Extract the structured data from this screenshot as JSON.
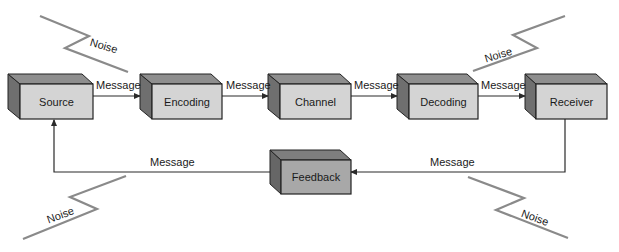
{
  "diagram": {
    "type": "communication-process-model",
    "colors": {
      "box_front": "#d4d4d4",
      "box_top": "#8e8e8e",
      "box_side": "#6f6f6f",
      "feedback_front": "#a8a8a8",
      "feedback_top": "#7e7e7e",
      "feedback_side": "#666666",
      "line": "#2a2a2a",
      "noise_line": "#8a8a8a"
    },
    "nodes": [
      {
        "id": "source",
        "label": "Source"
      },
      {
        "id": "encoding",
        "label": "Encoding"
      },
      {
        "id": "channel",
        "label": "Channel"
      },
      {
        "id": "decoding",
        "label": "Decoding"
      },
      {
        "id": "receiver",
        "label": "Receiver"
      },
      {
        "id": "feedback",
        "label": "Feedback"
      }
    ],
    "edges": [
      {
        "from": "source",
        "to": "encoding",
        "label": "Message"
      },
      {
        "from": "encoding",
        "to": "channel",
        "label": "Message"
      },
      {
        "from": "channel",
        "to": "decoding",
        "label": "Message"
      },
      {
        "from": "decoding",
        "to": "receiver",
        "label": "Message"
      },
      {
        "from": "receiver",
        "to": "feedback",
        "label": "Message"
      },
      {
        "from": "feedback",
        "to": "source",
        "label": "Message"
      }
    ],
    "noise": [
      {
        "position": "top-left",
        "label": "Noise"
      },
      {
        "position": "top-right",
        "label": "Noise"
      },
      {
        "position": "bottom-left",
        "label": "Noise"
      },
      {
        "position": "bottom-right",
        "label": "Noise"
      }
    ]
  }
}
